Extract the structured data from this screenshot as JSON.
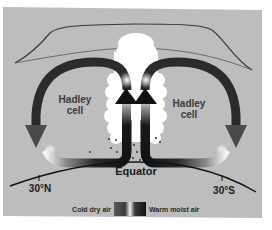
{
  "diagram": {
    "labels": {
      "left_cell_line1": "Hadley",
      "left_cell_line2": "cell",
      "right_cell_line1": "Hadley",
      "right_cell_line2": "cell",
      "equator": "Equator",
      "lat_north": "30°N",
      "lat_south": "30°S"
    },
    "legend": {
      "cold_label": "Cold dry air",
      "warm_label": "Warm moist air"
    },
    "colors": {
      "page_background": "#ffffff",
      "panel_background": "#bdbdbd",
      "arrow_dark": "#1c1c1c",
      "arrow_mid": "#4a4a4a",
      "arrow_light": "#f5f5f5",
      "cloud": "#ffffff",
      "tropopause_line": "#3a3a3a",
      "ground_line": "#111111"
    }
  }
}
